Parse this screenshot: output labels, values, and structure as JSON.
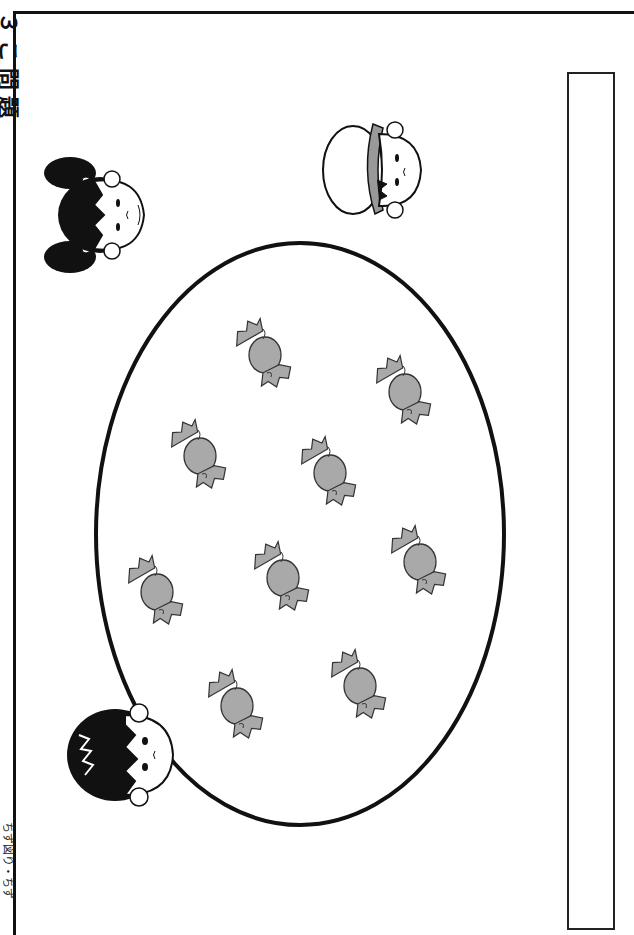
{
  "worksheet": {
    "title": "３こ問題",
    "footer": "ちず図り・ちず",
    "answer_box": {
      "value": ""
    }
  },
  "scene": {
    "plate": {
      "cx": 300,
      "cy": 534,
      "rx": 204,
      "ry": 291
    },
    "candy_color": "#a9a9a9",
    "candies": [
      {
        "x": 265,
        "y": 355
      },
      {
        "x": 405,
        "y": 392
      },
      {
        "x": 200,
        "y": 456
      },
      {
        "x": 330,
        "y": 473
      },
      {
        "x": 420,
        "y": 562
      },
      {
        "x": 283,
        "y": 578
      },
      {
        "x": 157,
        "y": 592
      },
      {
        "x": 360,
        "y": 686
      },
      {
        "x": 237,
        "y": 706
      }
    ],
    "children": [
      {
        "name": "girl-with-pigtails",
        "x": 100,
        "y": 215
      },
      {
        "name": "boy-with-cap",
        "x": 375,
        "y": 170
      },
      {
        "name": "boy",
        "x": 125,
        "y": 755
      }
    ]
  }
}
